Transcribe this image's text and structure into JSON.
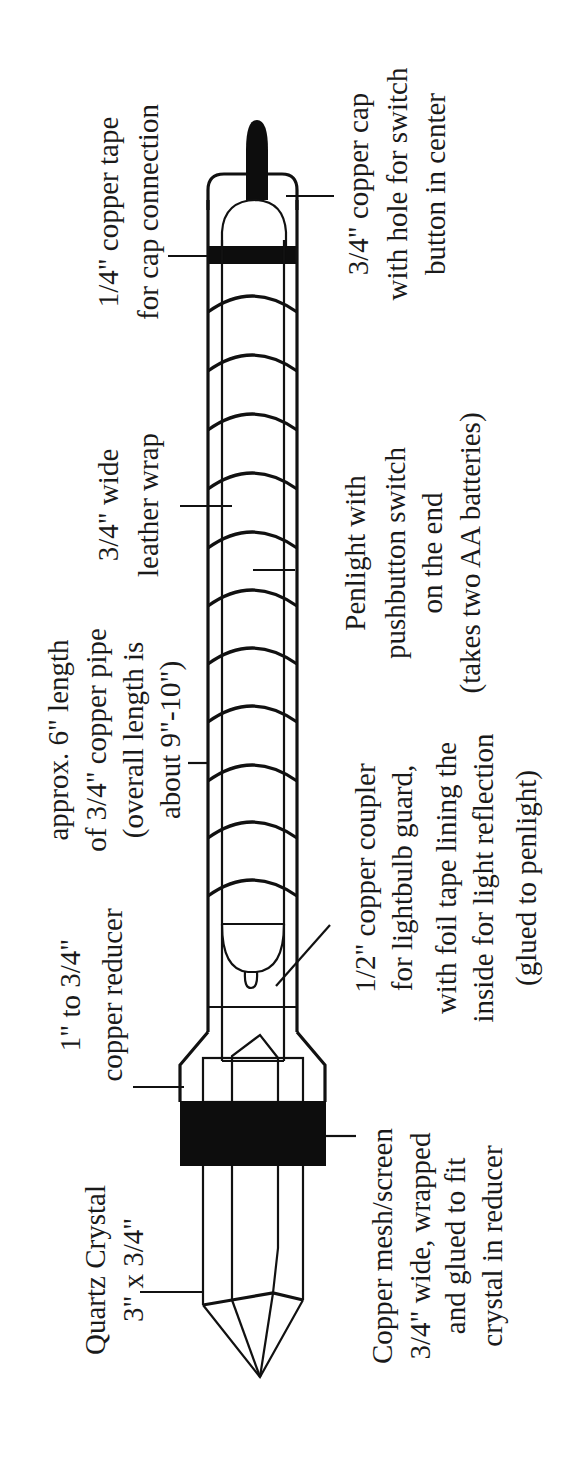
{
  "colors": {
    "ink": "#111111",
    "background": "#ffffff"
  },
  "labels": {
    "copper_tape": {
      "lines": [
        "1/4\" copper tape",
        "for cap connection"
      ]
    },
    "copper_cap": {
      "lines": [
        "3/4\" copper cap",
        "with hole for switch",
        "button in center"
      ]
    },
    "leather_wrap": {
      "lines": [
        "3/4\" wide",
        "leather wrap"
      ]
    },
    "penlight": {
      "lines": [
        "Penlight with",
        "pushbutton switch",
        "on the end",
        "(takes two AA batteries)"
      ]
    },
    "copper_pipe": {
      "lines": [
        "approx. 6\" length",
        "of 3/4\" copper pipe",
        "(overall length is",
        "about 9\"-10\")"
      ]
    },
    "coupler": {
      "lines": [
        "1/2\" copper coupler",
        "for lightbulb guard,",
        "with foil tape lining the",
        "inside for light reflection",
        "(glued to penlight)"
      ]
    },
    "reducer": {
      "lines": [
        "1\" to 3/4\"",
        "copper reducer"
      ]
    },
    "mesh": {
      "lines": [
        "Copper mesh/screen",
        "3/4\" wide, wrapped",
        "and glued to fit",
        "crystal in reducer"
      ]
    },
    "crystal": {
      "lines": [
        "Quartz Crystal",
        "3\" x 3/4\""
      ]
    }
  },
  "parts": [
    "pushbutton-switch",
    "copper-cap",
    "copper-tape",
    "leather-wrap",
    "copper-pipe",
    "penlight",
    "lightbulb",
    "copper-coupler",
    "copper-reducer",
    "copper-mesh",
    "quartz-crystal"
  ]
}
